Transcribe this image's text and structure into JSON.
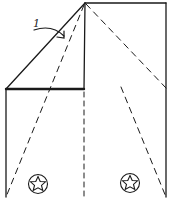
{
  "diagram": {
    "type": "origami-instruction-step",
    "step_label": "1",
    "colors": {
      "line": "#1a1a1a",
      "background": "#ffffff"
    },
    "elements": {
      "arrow": "fold-arrow-icon",
      "markers": [
        "star-circle-icon",
        "star-circle-icon"
      ]
    }
  }
}
